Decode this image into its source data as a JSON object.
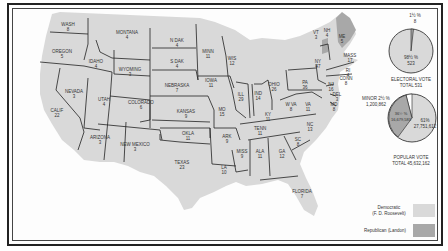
{
  "colors": {
    "democratic": "#d9d9d9",
    "republican": "#a8a8a8",
    "minor": "#ffffff",
    "border": "#222222"
  },
  "states": [
    {
      "name": "WASH",
      "votes": "8",
      "x": 68,
      "y": 26
    },
    {
      "name": "OREGON",
      "votes": "5",
      "x": 62,
      "y": 53
    },
    {
      "name": "CALIF",
      "votes": "22",
      "x": 57,
      "y": 112
    },
    {
      "name": "NEVADA",
      "votes": "3",
      "x": 74,
      "y": 93
    },
    {
      "name": "IDAHO",
      "votes": "4",
      "x": 96,
      "y": 63
    },
    {
      "name": "MONTANA",
      "votes": "4",
      "x": 127,
      "y": 34
    },
    {
      "name": "WYOMING",
      "votes": "3",
      "x": 130,
      "y": 71
    },
    {
      "name": "UTAH",
      "votes": "4",
      "x": 104,
      "y": 101
    },
    {
      "name": "COLORADO",
      "votes": "6",
      "x": 141,
      "y": 104
    },
    {
      "name": "ARIZONA",
      "votes": "3",
      "x": 100,
      "y": 139
    },
    {
      "name": "NEW MEXICO",
      "votes": "3",
      "x": 135,
      "y": 146
    },
    {
      "name": "N DAK",
      "votes": "4",
      "x": 177,
      "y": 42
    },
    {
      "name": "S DAK",
      "votes": "4",
      "x": 177,
      "y": 63
    },
    {
      "name": "NEBRASKA",
      "votes": "7",
      "x": 177,
      "y": 87
    },
    {
      "name": "KANSAS",
      "votes": "9",
      "x": 186,
      "y": 113
    },
    {
      "name": "OKLA",
      "votes": "11",
      "x": 188,
      "y": 135
    },
    {
      "name": "TEXAS",
      "votes": "23",
      "x": 182,
      "y": 164
    },
    {
      "name": "MINN",
      "votes": "11",
      "x": 208,
      "y": 53
    },
    {
      "name": "IOWA",
      "votes": "11",
      "x": 211,
      "y": 82
    },
    {
      "name": "MO",
      "votes": "15",
      "x": 222,
      "y": 111
    },
    {
      "name": "ARK",
      "votes": "9",
      "x": 227,
      "y": 138
    },
    {
      "name": "LA",
      "votes": "10",
      "x": 224,
      "y": 169
    },
    {
      "name": "WIS",
      "votes": "12",
      "x": 232,
      "y": 60
    },
    {
      "name": "ILL",
      "votes": "29",
      "x": 241,
      "y": 96
    },
    {
      "name": "IND",
      "votes": "14",
      "x": 258,
      "y": 95
    },
    {
      "name": "OHIO",
      "votes": "26",
      "x": 274,
      "y": 86
    },
    {
      "name": "KY",
      "votes": "11",
      "x": 268,
      "y": 116
    },
    {
      "name": "TENN",
      "votes": "11",
      "x": 260,
      "y": 130
    },
    {
      "name": "MISS",
      "votes": "9",
      "x": 242,
      "y": 153
    },
    {
      "name": "ALA",
      "votes": "11",
      "x": 260,
      "y": 153
    },
    {
      "name": "GA",
      "votes": "12",
      "x": 282,
      "y": 153
    },
    {
      "name": "FLORIDA",
      "votes": "7",
      "x": 302,
      "y": 193
    },
    {
      "name": "SC",
      "votes": "8",
      "x": 298,
      "y": 141
    },
    {
      "name": "NC",
      "votes": "13",
      "x": 310,
      "y": 126
    },
    {
      "name": "VA",
      "votes": "11",
      "x": 308,
      "y": 106
    },
    {
      "name": "W VA",
      "votes": "8",
      "x": 291,
      "y": 106
    },
    {
      "name": "PA",
      "votes": "36",
      "x": 305,
      "y": 84
    },
    {
      "name": "NY",
      "votes": "47",
      "x": 318,
      "y": 63
    },
    {
      "name": "VT",
      "votes": "3",
      "x": 316,
      "y": 34
    },
    {
      "name": "NH",
      "votes": "4",
      "x": 327,
      "y": 32
    },
    {
      "name": "ME",
      "votes": "5",
      "x": 342,
      "y": 38
    },
    {
      "name": "MASS",
      "votes": "17",
      "x": 350,
      "y": 57
    },
    {
      "name": "RI",
      "votes": "4",
      "x": 348,
      "y": 72
    },
    {
      "name": "CONN",
      "votes": "8",
      "x": 346,
      "y": 80
    },
    {
      "name": "NJ",
      "votes": "16",
      "x": 331,
      "y": 86
    },
    {
      "name": "DEL",
      "votes": "3",
      "x": 337,
      "y": 96
    },
    {
      "name": "MD",
      "votes": "8",
      "x": 334,
      "y": 106
    }
  ],
  "electoral_chart": {
    "minor_pct": "1½ %",
    "minor_votes": "8",
    "main_pct": "98½ %",
    "main_votes": "523",
    "caption_line1": "ELECTORAL VOTE",
    "caption_line2": "TOTAL  531"
  },
  "popular_chart": {
    "minor_label": "MINOR 2½ %",
    "minor_votes": "1,200,862",
    "rep_pct": "36½ %",
    "rep_votes": "16,679,583",
    "dem_pct": "61%",
    "dem_votes": "27,751,612",
    "caption_line1": "POPULAR VOTE",
    "caption_line2": "TOTAL 45,632,162"
  },
  "legend": [
    {
      "label_line1": "Democratic",
      "label_line2": "(F. D. Roosevelt)",
      "color": "#d9d9d9"
    },
    {
      "label_line1": "Republican (Landon)",
      "label_line2": "",
      "color": "#a8a8a8"
    }
  ],
  "chart_data": [
    {
      "type": "pie",
      "title": "ELECTORAL VOTE TOTAL 531",
      "categories": [
        "Democratic",
        "Republican"
      ],
      "values": [
        523,
        8
      ],
      "percent": [
        98.5,
        1.5
      ]
    },
    {
      "type": "pie",
      "title": "POPULAR VOTE TOTAL 45,632,162",
      "categories": [
        "Democratic",
        "Republican",
        "Minor"
      ],
      "values": [
        27751612,
        16679583,
        1200862
      ],
      "percent": [
        61,
        36.5,
        2.5
      ]
    }
  ]
}
